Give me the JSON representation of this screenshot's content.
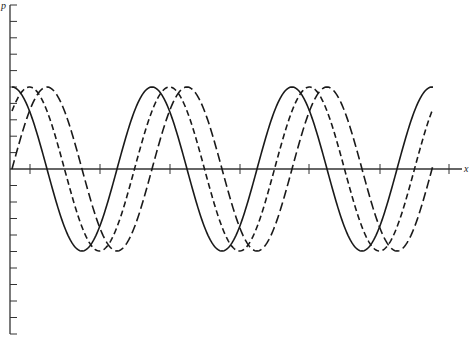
{
  "chart_data": {
    "type": "line",
    "title": "",
    "xlabel": "x",
    "ylabel": "p",
    "grid": false,
    "legend": null,
    "axes": {
      "y_ticks_above_axis": 10,
      "y_ticks_below_axis": 10,
      "x_ticks": 7,
      "tick_labels": []
    },
    "period_units": 1.0,
    "amplitude": 1.0,
    "x_range_periods": [
      0,
      3
    ],
    "series": [
      {
        "name": "solid wave",
        "style": "solid",
        "phase_shift_periods": 0.0,
        "function": "cos",
        "description": "starts at maximum"
      },
      {
        "name": "short-dash wave",
        "style": "short-dash",
        "phase_shift_periods": 0.125,
        "function": "cos",
        "description": "lags by 1/8 period"
      },
      {
        "name": "long-dash wave",
        "style": "long-dash",
        "phase_shift_periods": 0.25,
        "function": "cos",
        "description": "lags by 1/4 period (starts at zero rising)"
      }
    ]
  },
  "layout": {
    "origin_x": 12,
    "axis_y": 169,
    "period_px": 140,
    "amplitude_px": 82,
    "curve_end_x": 433,
    "y_axis_x": 10,
    "y_axis_top": 5,
    "y_axis_bottom": 334,
    "y_tick_spacing": 16.45,
    "x_axis_end": 462,
    "x_ticks_px": [
      30,
      100,
      170,
      240,
      309,
      380,
      449
    ],
    "colors": {
      "line": "#1a1a1a",
      "axis": "#333333"
    }
  }
}
